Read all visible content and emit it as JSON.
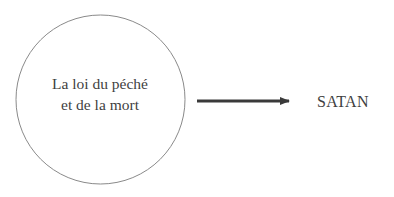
{
  "diagram": {
    "source_node": {
      "lines": [
        "La loi du péché",
        "et de la mort"
      ],
      "shape": "circle"
    },
    "edge": {
      "direction": "right",
      "style": "arrow"
    },
    "target_node": {
      "label": "SATAN"
    },
    "colors": {
      "circle_stroke": "#8a8a8a",
      "text": "#3f3f3f",
      "arrow": "#3a3a3a",
      "background": "#ffffff"
    }
  }
}
